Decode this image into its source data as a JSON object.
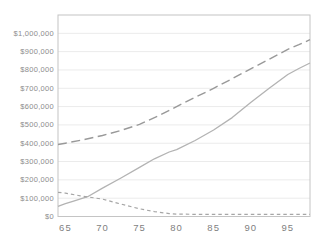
{
  "chart_data": {
    "type": "line",
    "title": "",
    "xlabel": "",
    "ylabel": "",
    "x_range": [
      64,
      98
    ],
    "y_range": [
      0,
      1100000
    ],
    "x_ticks": [
      {
        "label": "65",
        "value": 65
      },
      {
        "label": "70",
        "value": 70
      },
      {
        "label": "75",
        "value": 75
      },
      {
        "label": "80",
        "value": 80
      },
      {
        "label": "85",
        "value": 85
      },
      {
        "label": "90",
        "value": 90
      },
      {
        "label": "95",
        "value": 95
      }
    ],
    "y_ticks": [
      {
        "label": "$0",
        "value": 0
      },
      {
        "label": "$100,000",
        "value": 100000
      },
      {
        "label": "$200,000",
        "value": 200000
      },
      {
        "label": "$300,000",
        "value": 300000
      },
      {
        "label": "$400,000",
        "value": 400000
      },
      {
        "label": "$500,000",
        "value": 500000
      },
      {
        "label": "$600,000",
        "value": 600000
      },
      {
        "label": "$700,000",
        "value": 700000
      },
      {
        "label": "$800,000",
        "value": 800000
      },
      {
        "label": "$900,000",
        "value": 900000
      },
      {
        "label": "$1,000,000",
        "value": 1000000
      }
    ],
    "grid": "horizontal-only",
    "legend": "none",
    "colors": {
      "background": "#ffffff",
      "plot_border": "#c4c4c4",
      "gridline": "#ebebeb",
      "tick_text": "#8c8c8c"
    },
    "series": [
      {
        "name": "upper-long-dash-line",
        "line_style": "long-dash",
        "color": "#999999",
        "width": 1.4,
        "points": [
          [
            64,
            393000
          ],
          [
            65,
            400000
          ],
          [
            67.5,
            420000
          ],
          [
            70,
            442000
          ],
          [
            72.5,
            470000
          ],
          [
            75,
            503000
          ],
          [
            77.5,
            549000
          ],
          [
            80,
            600000
          ],
          [
            82.5,
            650000
          ],
          [
            85,
            700000
          ],
          [
            87.5,
            752000
          ],
          [
            90,
            806000
          ],
          [
            92.5,
            858000
          ],
          [
            95,
            913000
          ],
          [
            96.5,
            938000
          ],
          [
            98,
            965000
          ]
        ]
      },
      {
        "name": "middle-solid-line",
        "line_style": "solid",
        "color": "#b3b3b3",
        "width": 1.3,
        "points": [
          [
            64,
            55000
          ],
          [
            65,
            70000
          ],
          [
            66,
            83000
          ],
          [
            68,
            108000
          ],
          [
            70,
            155000
          ],
          [
            72.5,
            210000
          ],
          [
            75,
            268000
          ],
          [
            77,
            315000
          ],
          [
            79,
            352000
          ],
          [
            80,
            365000
          ],
          [
            82.5,
            415000
          ],
          [
            85,
            472000
          ],
          [
            87.5,
            540000
          ],
          [
            90,
            622000
          ],
          [
            92.5,
            700000
          ],
          [
            95,
            775000
          ],
          [
            96.5,
            808000
          ],
          [
            98,
            838000
          ]
        ]
      },
      {
        "name": "lower-short-dash-line",
        "line_style": "short-dash",
        "color": "#a6a6a6",
        "width": 1.2,
        "points": [
          [
            64,
            132000
          ],
          [
            65,
            128000
          ],
          [
            67,
            113000
          ],
          [
            68,
            107000
          ],
          [
            70,
            95000
          ],
          [
            72,
            73000
          ],
          [
            75,
            42000
          ],
          [
            77,
            27000
          ],
          [
            79,
            16000
          ],
          [
            80,
            13000
          ],
          [
            82,
            12000
          ],
          [
            85,
            12000
          ],
          [
            90,
            12000
          ],
          [
            95,
            12000
          ],
          [
            98,
            12000
          ]
        ]
      }
    ]
  }
}
